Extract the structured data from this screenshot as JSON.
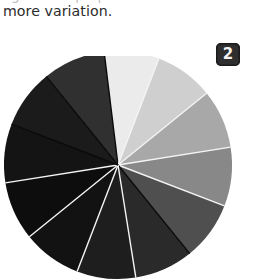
{
  "page": {
    "background_color": "#ffffff",
    "width": 253,
    "height": 280
  },
  "text": {
    "clipped_top_line": "significant proportion of the variance, allowing",
    "body_line": "more variation."
  },
  "figure": {
    "badge_label": "2",
    "badge_background": "#2e2e2e",
    "badge_text_color": "#f2f2f2"
  },
  "chart_data": {
    "type": "pie",
    "title": "",
    "subtitle": "",
    "xlabel": "",
    "ylabel": "",
    "legend": "none",
    "grid": false,
    "center_x": 118,
    "center_y": 165,
    "radius": 114,
    "start_angle_deg": -97,
    "separator_light": "#f4f4f4",
    "separator_dark": "#0a0a0a",
    "categories": [
      "wedge-1",
      "wedge-2",
      "wedge-3",
      "wedge-4",
      "wedge-5",
      "wedge-6",
      "wedge-7",
      "wedge-8",
      "wedge-9",
      "wedge-10",
      "wedge-11",
      "wedge-12"
    ],
    "values": [
      28,
      30,
      30,
      30,
      30,
      30,
      30,
      30,
      30,
      30,
      30,
      32
    ],
    "slice_colors": [
      "#ebebeb",
      "#cfcfcf",
      "#a8a8a8",
      "#888888",
      "#4f4f4f",
      "#2a2a2a",
      "#1e1e1e",
      "#121212",
      "#0d0d0d",
      "#141414",
      "#1b1b1b",
      "#303030"
    ],
    "separator_per_slice": [
      "#0a0a0a",
      "#f4f4f4",
      "#f4f4f4",
      "#f4f4f4",
      "#f4f4f4",
      "#0a0a0a",
      "#f4f4f4",
      "#f4f4f4",
      "#f4f4f4",
      "#f4f4f4",
      "#0a0a0a",
      "#0a0a0a"
    ],
    "note": "Grayscale pie with 12 wedges of near-equal size; clipped by the figure frame at top and bottom."
  }
}
